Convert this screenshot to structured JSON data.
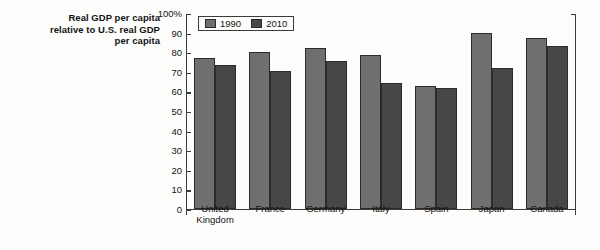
{
  "chart_data": {
    "type": "bar",
    "title": "Real GDP per capita relative to U.S. real GDP per capita",
    "xlabel": "",
    "ylabel": "",
    "ylim": [
      0,
      100
    ],
    "yticks": [
      "0",
      "10",
      "20",
      "30",
      "40",
      "50",
      "60",
      "70",
      "80",
      "90",
      "100%"
    ],
    "grid": false,
    "legend_position": "top-left-inside",
    "categories": [
      "United Kingdom",
      "France",
      "Germany",
      "Italy",
      "Spain",
      "Japan",
      "Canada"
    ],
    "series": [
      {
        "name": "1990",
        "color": "#6f6f6f",
        "values": [
          77,
          80,
          82,
          78.5,
          62.5,
          89.5,
          87
        ]
      },
      {
        "name": "2010",
        "color": "#474747",
        "values": [
          73.5,
          70,
          75.5,
          64,
          61.5,
          71.5,
          83
        ]
      }
    ]
  },
  "axis_title": {
    "line1": "Real GDP per capita",
    "line2": "relative to U.S. real GDP",
    "line3": "per capita"
  }
}
